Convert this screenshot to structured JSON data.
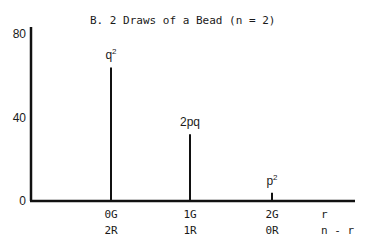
{
  "chart_data": {
    "type": "bar",
    "title": "B.  2 Draws of a Bead (n = 2)",
    "xlabel": "",
    "ylabel": "",
    "ylim": [
      0,
      80
    ],
    "yticks": [
      0,
      40,
      80
    ],
    "grid": false,
    "categories": [
      {
        "top": "0G",
        "bottom": "2R"
      },
      {
        "top": "1G",
        "bottom": "1R"
      },
      {
        "top": "2G",
        "bottom": "0R"
      }
    ],
    "axis_end_labels": {
      "top": "r",
      "bottom": "n - r"
    },
    "values": [
      64,
      32,
      4
    ],
    "bar_labels": [
      {
        "base": "q",
        "sup": "2"
      },
      {
        "base": "2pq",
        "sup": ""
      },
      {
        "base": "p",
        "sup": "2"
      }
    ]
  }
}
